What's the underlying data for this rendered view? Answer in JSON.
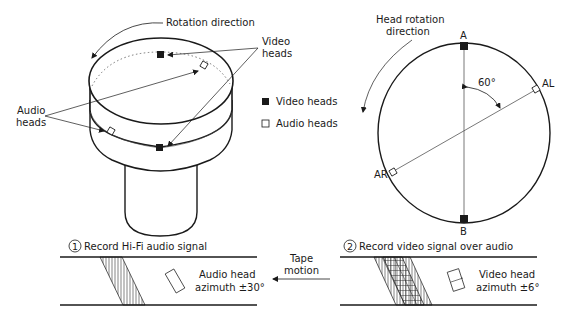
{
  "drum_diagram": {
    "rotation_label": "Rotation direction",
    "video_heads_label_1": "Video",
    "video_heads_label_2": "heads",
    "audio_heads_label_1": "Audio",
    "audio_heads_label_2": "heads"
  },
  "legend": {
    "items": [
      {
        "symbol": "filled-square",
        "label": "Video heads"
      },
      {
        "symbol": "open-square",
        "label": "Audio heads"
      }
    ]
  },
  "circle_diagram": {
    "rotation_label_1": "Head rotation",
    "rotation_label_2": "direction",
    "angle_label": "60°",
    "point_a": "A",
    "point_b": "B",
    "point_al": "AL",
    "point_ar": "AR"
  },
  "tape_panels": {
    "panel1": {
      "number": "1",
      "title": "Record Hi-Fi audio signal",
      "head_label_1": "Audio head",
      "head_label_2": "azimuth ±30°"
    },
    "tape_motion_1": "Tape",
    "tape_motion_2": "motion",
    "panel2": {
      "number": "2",
      "title": "Record video signal over audio",
      "head_label_1": "Video head",
      "head_label_2": "azimuth ±6°"
    }
  }
}
